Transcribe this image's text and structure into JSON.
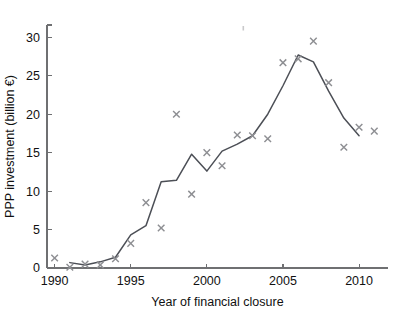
{
  "chart_data": {
    "type": "line",
    "title": "",
    "xlabel": "Year of financial closure",
    "ylabel": "PPP investment (billion €)",
    "xlim": [
      1989.5,
      2011.9
    ],
    "ylim": [
      0,
      31.6
    ],
    "xticks": [
      1990,
      1995,
      2000,
      2005,
      2010
    ],
    "xtick_labels": [
      "1990",
      "1995",
      "2000",
      "2005",
      "2010"
    ],
    "xticks_minor": [
      1991,
      1992,
      1993,
      1994,
      1996,
      1997,
      1998,
      1999,
      2001,
      2002,
      2003,
      2004,
      2006,
      2007,
      2008,
      2009,
      2011
    ],
    "yticks": [
      0,
      5,
      10,
      15,
      20,
      25,
      30
    ],
    "ytick_labels": [
      "0",
      "5",
      "10",
      "15",
      "20",
      "25",
      "30"
    ],
    "grid": false,
    "legend": null,
    "legend_position": "none",
    "x": [
      1990,
      1991,
      1992,
      1993,
      1994,
      1995,
      1996,
      1997,
      1998,
      1999,
      2000,
      2001,
      2002,
      2003,
      2004,
      2005,
      2006,
      2007,
      2008,
      2009,
      2010,
      2011
    ],
    "series": [
      {
        "name": "scatter-markers",
        "marker": "x",
        "color": "#8e8f93",
        "style": "scatter",
        "values": [
          1.3,
          0.1,
          0.5,
          0.4,
          1.2,
          3.2,
          8.5,
          5.2,
          20.0,
          9.6,
          15.0,
          13.3,
          17.3,
          17.2,
          16.8,
          26.7,
          27.2,
          29.5,
          24.1,
          15.7,
          18.3,
          17.8
        ]
      },
      {
        "name": "trend-line",
        "marker": "none",
        "color": "#4c4f56",
        "style": "line",
        "values": [
          null,
          0.7,
          0.4,
          0.8,
          1.4,
          4.3,
          5.5,
          11.2,
          11.4,
          14.8,
          12.6,
          15.2,
          16.1,
          17.2,
          20.0,
          23.7,
          27.7,
          26.8,
          23.0,
          19.5,
          17.2,
          null
        ]
      }
    ]
  },
  "caption": {
    "text": ""
  }
}
